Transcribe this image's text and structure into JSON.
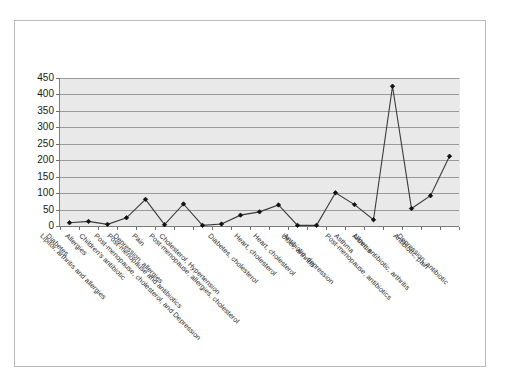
{
  "chart_data": {
    "type": "line",
    "title": "",
    "subtitle": "",
    "xlabel": "",
    "ylabel": "",
    "ylim": [
      0,
      450
    ],
    "yticks": [
      0,
      50,
      100,
      150,
      200,
      250,
      300,
      350,
      400,
      450
    ],
    "grid": true,
    "legend": false,
    "legend_position": "none",
    "marker": "filled-diamond",
    "line_color": "#3a3a3a",
    "marker_color": "#111111",
    "plot_background": "#e9e9e9",
    "figure_background": "#ffffff",
    "categories": [
      "Diabetes",
      "Allergies",
      "Lipitor, arthritis and allergies",
      "Children's antibiotic",
      "Pain",
      "Depression, allergies",
      "Post-menopause and antibiotics",
      "Post-menopause, cholesterol, and Depression",
      "Cholesterol, Hypertension",
      "Post-menopause, allergies, cholesterol",
      "Diabetes, cholesterol",
      "Heart, cholesterol",
      "Heart, cholesterol",
      "Ulcer, arthritis",
      "Antibiotic, depression",
      "Asthma",
      "Arthritis",
      "Post-menopause, antibiotics",
      "Ulcer, antibiotic, arthritis",
      "Antibiotic, pain",
      "Depression, antibiotic"
    ],
    "values": [
      10,
      14,
      5,
      25,
      81,
      4,
      67,
      2,
      6,
      33,
      43,
      64,
      2,
      2,
      101,
      65,
      19,
      425,
      53,
      92,
      212
    ]
  }
}
